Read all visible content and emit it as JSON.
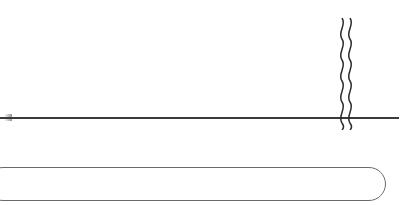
{
  "chart_data": {
    "type": "bar",
    "subtype": "stacked-column",
    "title": "",
    "xlabel": "(年度)",
    "ylabel": "",
    "grid": false,
    "legend": null,
    "axis_break": {
      "after_category": "2018E",
      "before_category": "2022E",
      "style": "wavy"
    },
    "categories": [
      "2006",
      "2007",
      "2008",
      "2009",
      "2010",
      "2011",
      "2012",
      "2013",
      "2014",
      "2015",
      "2016",
      "2017E",
      "2018E",
      "2022E"
    ],
    "values": [
      51.3,
      47.7,
      48.2,
      43.0,
      41.9,
      43.3,
      45.3,
      51.3,
      51.2,
      51.0,
      52.5,
      54.1,
      53.3,
      51.2
    ],
    "data_labels": [
      "51.3",
      "47.7",
      "48.2",
      "43.0",
      "41.9",
      "43.3",
      "45.3",
      "51.3",
      "51.2",
      "51.0",
      "52.5",
      "54.1",
      "53.3",
      "51.2"
    ],
    "series": [
      {
        "name": "bottom-segment",
        "color": "#a5a5a5",
        "values": [
          22.5,
          21.0,
          21.0,
          21.0,
          21.0,
          23.0,
          25.5,
          28.0,
          28.5,
          27.5,
          27.0,
          28.0,
          27.0,
          27.5
        ]
      },
      {
        "name": "middle-segment",
        "color": "#dedede",
        "values": [
          10.5,
          13.5,
          14.0,
          10.0,
          8.0,
          8.5,
          10.0,
          12.5,
          13.5,
          15.0,
          16.5,
          17.0,
          17.5,
          16.0
        ]
      },
      {
        "name": "top-segment",
        "color": "#ffffff",
        "values": [
          18.3,
          13.2,
          13.2,
          12.0,
          12.9,
          11.8,
          9.8,
          10.8,
          9.2,
          8.5,
          9.0,
          9.1,
          8.8,
          7.7
        ]
      }
    ],
    "estimated_categories": [
      "2017E",
      "2018E",
      "2022E"
    ]
  },
  "axis": {
    "unit_label": "（年\n度）",
    "years": [
      {
        "id": "2006",
        "text": "2\n0\n0\n6"
      },
      {
        "id": "2007",
        "text": "2\n0\n0\n7"
      },
      {
        "id": "2008",
        "text": "2\n0\n0\n8"
      },
      {
        "id": "2009",
        "text": "2\n0\n0\n9"
      },
      {
        "id": "2010",
        "text": "2\n0\n1\n0"
      },
      {
        "id": "2011",
        "text": "2\n0\n1\n1"
      },
      {
        "id": "2012",
        "text": "2\n0\n1\n2"
      },
      {
        "id": "2013",
        "text": "2\n0\n1\n3"
      },
      {
        "id": "2014",
        "text": "2\n0\n1\n4"
      },
      {
        "id": "2015",
        "text": "2\n0\n1\n5"
      },
      {
        "id": "2016",
        "text": "2\n0\n1\n6"
      },
      {
        "id": "2017E",
        "text": "2\n0\n1\n7\nE"
      },
      {
        "id": "2018E",
        "text": "2\n0\n1\n8\nE"
      },
      {
        "id": "2022E",
        "text": "2\n0\n2\n2\nE"
      }
    ]
  },
  "colors": {
    "segment_top": "#ffffff",
    "segment_middle": "#dedede",
    "segment_bottom": "#a5a5a5",
    "outline": "#4a4a4a",
    "axis": "#3a3a3a",
    "text": "#1a1a1a"
  }
}
